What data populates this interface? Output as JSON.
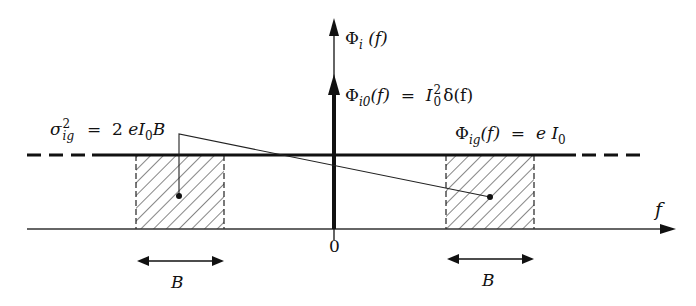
{
  "diagram": {
    "type": "power-spectral-density-sketch",
    "axes": {
      "vertical_label": {
        "symbol": "Φ",
        "sub": "i",
        "arg": "(f)"
      },
      "horizontal_label": "f",
      "origin_label": "0"
    },
    "delta_label": {
      "lhs_symbol": "Φ",
      "lhs_sub": "i0",
      "lhs_arg": "(f)",
      "eq": "=",
      "rhs_base": "I",
      "rhs_sup": "2",
      "rhs_sub": "0",
      "rhs_tail": "δ(f)"
    },
    "level_label": {
      "lhs_symbol": "Φ",
      "lhs_sub": "ig",
      "lhs_arg": "(f)",
      "eq": "=",
      "rhs_e": "e",
      "rhs_base": "I",
      "rhs_sub": "0"
    },
    "variance_label": {
      "symbol": "σ",
      "sup": "2",
      "sub": "ig",
      "eq": "=",
      "rhs_num": "2",
      "rhs_e": "e",
      "rhs_base": "I",
      "rhs_sub": "0",
      "rhs_tail": "B"
    },
    "bandwidth_labels": [
      "B",
      "B"
    ],
    "colors": {
      "ink": "#111111",
      "background": "#ffffff"
    }
  }
}
